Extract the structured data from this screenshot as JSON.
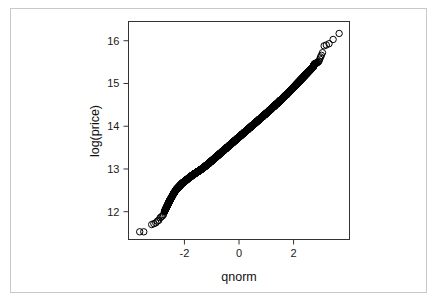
{
  "figure": {
    "kind": "qq-plot",
    "background_color": "#ffffff",
    "frame_color": "#c9c9c9",
    "axis_color": "#333333",
    "point_color": "#000000"
  },
  "chart_data": {
    "type": "scatter",
    "title": "",
    "xlabel": "qnorm",
    "ylabel": "log(price)",
    "xlim": [
      -4.05,
      4.05
    ],
    "ylim": [
      11.35,
      16.45
    ],
    "xticks": [
      -2,
      0,
      2
    ],
    "xticklabels": [
      "-2",
      "0",
      "2"
    ],
    "yticks": [
      12,
      13,
      14,
      15,
      16
    ],
    "yticklabels": [
      "12",
      "13",
      "14",
      "15",
      "16"
    ],
    "grid": false,
    "legend": null,
    "marker": "open-circle",
    "marker_size": 3.2,
    "series": [
      {
        "name": "log(price) vs normal quantiles",
        "x": [
          -3.64,
          -3.49,
          -3.2,
          -3.12,
          -3.05,
          -2.99,
          -2.94,
          -2.89,
          -2.85,
          -2.81,
          -2.77,
          -2.73,
          -2.7,
          -2.66,
          -2.63,
          -2.6,
          -2.57,
          -2.54,
          -2.51,
          -2.48,
          -2.45,
          -2.42,
          -2.39,
          -2.36,
          -2.33,
          -2.3,
          -2.27,
          -2.24,
          -2.21,
          -2.18,
          -2.15,
          -2.12,
          -2.09,
          -2.06,
          -2.02,
          -1.99,
          -1.96,
          -1.93,
          -1.9,
          -1.87,
          -1.84,
          -1.81,
          -1.78,
          -1.75,
          -1.72,
          -1.69,
          -1.66,
          -1.63,
          -1.6,
          -1.57,
          -1.54,
          -1.51,
          -1.48,
          -1.45,
          -1.42,
          -1.39,
          -1.36,
          -1.33,
          -1.3,
          -1.27,
          -1.24,
          -1.21,
          -1.18,
          -1.15,
          -1.12,
          -1.09,
          -1.06,
          -1.03,
          -1.0,
          -0.97,
          -0.94,
          -0.91,
          -0.88,
          -0.85,
          -0.82,
          -0.79,
          -0.76,
          -0.73,
          -0.7,
          -0.67,
          -0.64,
          -0.61,
          -0.58,
          -0.55,
          -0.52,
          -0.49,
          -0.46,
          -0.43,
          -0.4,
          -0.37,
          -0.34,
          -0.31,
          -0.28,
          -0.25,
          -0.22,
          -0.19,
          -0.16,
          -0.13,
          -0.1,
          -0.07,
          -0.04,
          -0.01,
          0.02,
          0.05,
          0.08,
          0.11,
          0.14,
          0.17,
          0.2,
          0.23,
          0.26,
          0.29,
          0.32,
          0.35,
          0.38,
          0.41,
          0.44,
          0.47,
          0.5,
          0.53,
          0.56,
          0.59,
          0.62,
          0.65,
          0.68,
          0.71,
          0.74,
          0.77,
          0.8,
          0.83,
          0.86,
          0.89,
          0.92,
          0.95,
          0.98,
          1.01,
          1.04,
          1.07,
          1.1,
          1.13,
          1.16,
          1.19,
          1.22,
          1.25,
          1.28,
          1.31,
          1.34,
          1.37,
          1.4,
          1.43,
          1.46,
          1.49,
          1.52,
          1.55,
          1.58,
          1.61,
          1.64,
          1.67,
          1.7,
          1.73,
          1.76,
          1.79,
          1.82,
          1.85,
          1.88,
          1.91,
          1.94,
          1.97,
          2.0,
          2.03,
          2.06,
          2.09,
          2.12,
          2.15,
          2.18,
          2.21,
          2.24,
          2.27,
          2.3,
          2.33,
          2.36,
          2.39,
          2.42,
          2.45,
          2.48,
          2.51,
          2.54,
          2.57,
          2.6,
          2.63,
          2.66,
          2.69,
          2.72,
          2.75,
          2.78,
          2.81,
          2.84,
          2.87,
          2.9,
          2.93,
          2.96,
          2.99,
          3.02,
          3.06,
          3.12,
          3.2,
          3.3,
          3.45,
          3.67
        ],
        "y": [
          11.53,
          11.53,
          11.7,
          11.72,
          11.74,
          11.78,
          11.8,
          11.86,
          11.88,
          11.9,
          11.93,
          12.0,
          12.05,
          12.1,
          12.14,
          12.18,
          12.22,
          12.26,
          12.29,
          12.33,
          12.36,
          12.4,
          12.43,
          12.46,
          12.49,
          12.52,
          12.54,
          12.56,
          12.58,
          12.6,
          12.62,
          12.64,
          12.66,
          12.68,
          12.69,
          12.71,
          12.73,
          12.74,
          12.76,
          12.77,
          12.79,
          12.8,
          12.82,
          12.83,
          12.85,
          12.86,
          12.87,
          12.89,
          12.9,
          12.91,
          12.93,
          12.94,
          12.95,
          12.96,
          12.98,
          12.99,
          13.0,
          13.02,
          13.03,
          13.05,
          13.06,
          13.08,
          13.09,
          13.11,
          13.12,
          13.14,
          13.16,
          13.17,
          13.19,
          13.21,
          13.22,
          13.24,
          13.26,
          13.27,
          13.29,
          13.31,
          13.32,
          13.34,
          13.36,
          13.37,
          13.39,
          13.41,
          13.42,
          13.44,
          13.46,
          13.47,
          13.49,
          13.51,
          13.52,
          13.54,
          13.56,
          13.57,
          13.59,
          13.61,
          13.62,
          13.64,
          13.66,
          13.67,
          13.69,
          13.71,
          13.72,
          13.74,
          13.76,
          13.77,
          13.79,
          13.81,
          13.82,
          13.84,
          13.86,
          13.87,
          13.89,
          13.91,
          13.92,
          13.94,
          13.96,
          13.97,
          13.99,
          14.01,
          14.02,
          14.04,
          14.06,
          14.07,
          14.09,
          14.11,
          14.12,
          14.14,
          14.16,
          14.17,
          14.19,
          14.21,
          14.22,
          14.24,
          14.26,
          14.27,
          14.29,
          14.31,
          14.32,
          14.34,
          14.36,
          14.38,
          14.39,
          14.41,
          14.43,
          14.45,
          14.46,
          14.48,
          14.5,
          14.52,
          14.53,
          14.55,
          14.57,
          14.59,
          14.61,
          14.62,
          14.64,
          14.66,
          14.68,
          14.7,
          14.72,
          14.73,
          14.75,
          14.77,
          14.79,
          14.81,
          14.83,
          14.85,
          14.87,
          14.89,
          14.91,
          14.93,
          14.95,
          14.97,
          14.99,
          15.01,
          15.03,
          15.05,
          15.07,
          15.09,
          15.11,
          15.13,
          15.15,
          15.17,
          15.19,
          15.21,
          15.23,
          15.25,
          15.27,
          15.29,
          15.31,
          15.33,
          15.35,
          15.37,
          15.39,
          15.44,
          15.46,
          15.47,
          15.48,
          15.49,
          15.5,
          15.52,
          15.57,
          15.62,
          15.66,
          15.72,
          15.88,
          15.9,
          15.93,
          16.03,
          16.17
        ]
      }
    ]
  }
}
